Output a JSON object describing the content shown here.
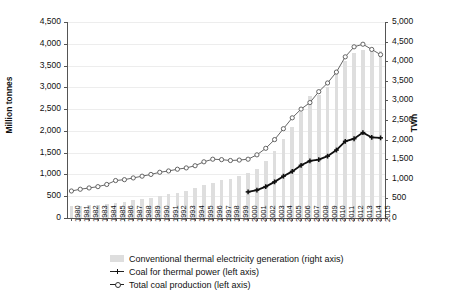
{
  "chart_data": {
    "type": "bar",
    "title": "",
    "xlabel": "",
    "ylabel": "Million tonnes",
    "ylabel_right": "TWh",
    "ylim": [
      0,
      4500
    ],
    "ylim_right": [
      0,
      5000
    ],
    "ytick_step": 500,
    "grid": true,
    "legend_position": "bottom",
    "categories": [
      "1980",
      "1981",
      "1982",
      "1983",
      "1984",
      "1985",
      "1986",
      "1987",
      "1988",
      "1989",
      "1990",
      "1991",
      "1992",
      "1993",
      "1994",
      "1995",
      "1996",
      "1997",
      "1998",
      "1999",
      "2000",
      "2001",
      "2002",
      "2003",
      "2004",
      "2005",
      "2006",
      "2007",
      "2008",
      "2009",
      "2010",
      "2011",
      "2012",
      "2013",
      "2014",
      "2015"
    ],
    "ytick_labels_left": [
      "0",
      "500",
      "1,000",
      "1,500",
      "2,000",
      "2,500",
      "3,000",
      "3,500",
      "4,000",
      "4,500"
    ],
    "ytick_labels_right": [
      "0",
      "500",
      "1,000",
      "1,500",
      "2,000",
      "2,500",
      "3,000",
      "3,500",
      "4,000",
      "4,500",
      "5,000"
    ],
    "series": [
      {
        "name": "Conventional thermal electricity generation (right axis)",
        "type": "bar",
        "axis": "right",
        "color": "#dedede",
        "values": [
          300,
          310,
          320,
          340,
          360,
          390,
          420,
          450,
          490,
          520,
          560,
          600,
          640,
          700,
          760,
          830,
          900,
          960,
          1000,
          1060,
          1160,
          1260,
          1450,
          1710,
          2020,
          2320,
          2700,
          3100,
          3150,
          3330,
          3720,
          4000,
          4200,
          4280,
          4270,
          4250
        ]
      },
      {
        "name": "Coal for thermal power (left axis)",
        "type": "line",
        "axis": "left",
        "color": "#111111",
        "marker": "cross",
        "start_year": "2000",
        "values": [
          null,
          null,
          null,
          null,
          null,
          null,
          null,
          null,
          null,
          null,
          null,
          null,
          null,
          null,
          null,
          null,
          null,
          null,
          null,
          null,
          600,
          640,
          720,
          830,
          960,
          1070,
          1210,
          1310,
          1340,
          1420,
          1560,
          1760,
          1820,
          1960,
          1850,
          1840
        ]
      },
      {
        "name": "Total coal production (left axis)",
        "type": "line",
        "axis": "left",
        "color": "#555555",
        "marker": "circle",
        "values": [
          620,
          660,
          690,
          720,
          770,
          860,
          880,
          920,
          960,
          1000,
          1050,
          1080,
          1120,
          1150,
          1200,
          1290,
          1350,
          1340,
          1320,
          1330,
          1350,
          1450,
          1600,
          1800,
          2050,
          2300,
          2500,
          2650,
          2900,
          3100,
          3350,
          3700,
          3930,
          3990,
          3870,
          3750
        ]
      }
    ]
  },
  "legend": {
    "items": [
      {
        "label": "Conventional thermal electricity generation (right axis)",
        "marker": "bar"
      },
      {
        "label": "Coal for thermal power (left axis)",
        "marker": "cross-line"
      },
      {
        "label": "Total coal production (left axis)",
        "marker": "circle-line"
      }
    ]
  }
}
